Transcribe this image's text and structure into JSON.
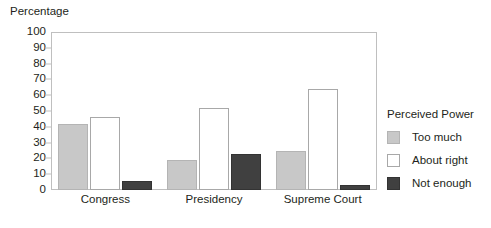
{
  "chart_data": {
    "type": "bar",
    "title": "",
    "xlabel": "",
    "ylabel": "Percentage",
    "ylim": [
      0,
      100
    ],
    "ytick_step": 10,
    "yticks": [
      100,
      90,
      80,
      70,
      60,
      50,
      40,
      30,
      20,
      10,
      0
    ],
    "grid": false,
    "legend_position": "right",
    "legend_title": "Perceived Power",
    "categories": [
      "Congress",
      "Presidency",
      "Supreme Court"
    ],
    "series": [
      {
        "name": "Too much",
        "color": "#c8c8c8",
        "values": [
          42,
          19,
          25
        ]
      },
      {
        "name": "About right",
        "color": "#ffffff",
        "values": [
          46,
          52,
          64
        ]
      },
      {
        "name": "Not enough",
        "color": "#404040",
        "values": [
          6,
          23,
          3
        ]
      }
    ]
  }
}
